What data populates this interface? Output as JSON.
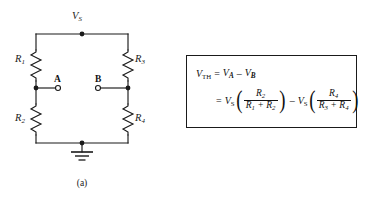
{
  "figure": {
    "panels": [
      {
        "id": "a",
        "caption": "(a)",
        "kind": "circuit-schematic"
      },
      {
        "id": "b",
        "caption": "(b)",
        "kind": "equation-box"
      }
    ]
  },
  "circuit": {
    "source_label": "V",
    "source_sub": "S",
    "ground_label": "ground",
    "terminals": [
      {
        "name": "A",
        "label": "A"
      },
      {
        "name": "B",
        "label": "B"
      }
    ],
    "resistors": [
      {
        "name": "R1",
        "label": "R",
        "sub": "1",
        "position": "top-left"
      },
      {
        "name": "R2",
        "label": "R",
        "sub": "2",
        "position": "bottom-left"
      },
      {
        "name": "R3",
        "label": "R",
        "sub": "3",
        "position": "top-right"
      },
      {
        "name": "R4",
        "label": "R",
        "sub": "4",
        "position": "bottom-right"
      }
    ]
  },
  "equation": {
    "line1": {
      "lhs_var": "V",
      "lhs_sub": "TH",
      "eq": "=",
      "t1_var": "V",
      "t1_sub": "A",
      "op": "–",
      "t2_var": "V",
      "t2_sub": "B"
    },
    "line2": {
      "eq": "=",
      "t1_var": "V",
      "t1_sub": "S",
      "f1_num": "R",
      "f1_num_sub": "2",
      "f1_den_a": "R",
      "f1_den_a_sub": "1",
      "f1_den_plus": "+",
      "f1_den_b": "R",
      "f1_den_b_sub": "2",
      "op": "–",
      "t2_var": "V",
      "t2_sub": "S",
      "f2_num": "R",
      "f2_num_sub": "4",
      "f2_den_a": "R",
      "f2_den_a_sub": "3",
      "f2_den_plus": "+",
      "f2_den_b": "R",
      "f2_den_b_sub": "4",
      "lparen": "(",
      "rparen": ")"
    }
  },
  "colors": {
    "ink": "#1a1a1a",
    "background": "#ffffff"
  }
}
